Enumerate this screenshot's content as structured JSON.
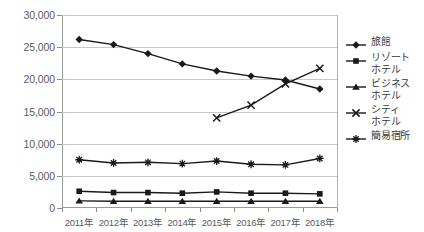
{
  "chart_data": {
    "type": "line",
    "title": "",
    "subtitle": "",
    "xlabel": "",
    "ylabel": "",
    "grid": true,
    "legend_position": "right",
    "categories": [
      "2011年",
      "2012年",
      "2013年",
      "2014年",
      "2015年",
      "2016年",
      "2017年",
      "2018年"
    ],
    "x_tick_labels": [
      "2011年",
      "2012年",
      "2013年",
      "2014年",
      "2015年",
      "2016年",
      "2017年",
      "2018年"
    ],
    "y_tick_labels": [
      "0",
      "5,000",
      "10,000",
      "15,000",
      "20,000",
      "25,000",
      "30,000"
    ],
    "y_tick_values": [
      0,
      5000,
      10000,
      15000,
      20000,
      25000,
      30000
    ],
    "ylim": [
      0,
      30000
    ],
    "series": [
      {
        "name": "旅館",
        "legend_label": "旅館",
        "marker": "diamond",
        "color": "#1a1a1a",
        "values": [
          26200,
          25400,
          24000,
          22400,
          21300,
          20500,
          19900,
          18500
        ]
      },
      {
        "name": "リゾートホテル",
        "legend_label": "リゾート\nホテル",
        "marker": "square",
        "color": "#1a1a1a",
        "values": [
          2600,
          2400,
          2400,
          2300,
          2500,
          2300,
          2300,
          2200
        ]
      },
      {
        "name": "ビジネスホテル",
        "legend_label": "ビジネス\nホテル",
        "marker": "triangle",
        "color": "#1a1a1a",
        "values": [
          1100,
          1050,
          1050,
          1050,
          1050,
          1050,
          1050,
          1050
        ]
      },
      {
        "name": "シティホテル",
        "legend_label": "シティ\nホテル",
        "marker": "cross",
        "color": "#1a1a1a",
        "values": [
          null,
          null,
          null,
          null,
          14000,
          16000,
          19300,
          21700
        ]
      },
      {
        "name": "簡易宿所",
        "legend_label": "簡易宿所",
        "marker": "asterisk",
        "color": "#1a1a1a",
        "values": [
          7500,
          7000,
          7100,
          6900,
          7300,
          6800,
          6700,
          7700
        ]
      }
    ],
    "colors": {
      "axis": "#9a9a9a",
      "gridline": "#c8c8c8",
      "series": "#1a1a1a",
      "tick_text": "#5b5b5b",
      "legend_text": "#3a3a3a",
      "background": "#ffffff"
    }
  }
}
